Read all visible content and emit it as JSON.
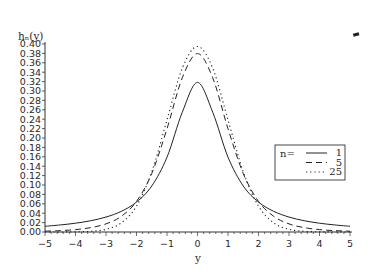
{
  "chart_data": {
    "type": "line",
    "title": "",
    "xlabel": "y",
    "ylabel": "h_n(y)",
    "ylabel_display": "hₙ(y)",
    "xlim": [
      -5,
      5
    ],
    "ylim": [
      0.0,
      0.4
    ],
    "xticks": [
      -5,
      -4,
      -3,
      -2,
      -1,
      0,
      1,
      2,
      3,
      4,
      5
    ],
    "xtick_labels": [
      "−5",
      "−4",
      "−3",
      "−2",
      "−1",
      "0",
      "1",
      "2",
      "3",
      "4",
      "5"
    ],
    "yticks": [
      0.0,
      0.02,
      0.04,
      0.06,
      0.08,
      0.1,
      0.12,
      0.14,
      0.16,
      0.18,
      0.2,
      0.22,
      0.24,
      0.26,
      0.28,
      0.3,
      0.32,
      0.34,
      0.36,
      0.38,
      0.4
    ],
    "ytick_labels": [
      "0.00",
      "0.02",
      "0.04",
      "0.06",
      "0.08",
      "0.10",
      "0.12",
      "0.14",
      "0.16",
      "0.18",
      "0.20",
      "0.22",
      "0.24",
      "0.26",
      "0.28",
      "0.30",
      "0.32",
      "0.34",
      "0.36",
      "0.38",
      "0.40"
    ],
    "grid": false,
    "legend": {
      "title": "n=",
      "position": "right-middle",
      "entries": [
        {
          "label": "1",
          "style": "solid"
        },
        {
          "label": "5",
          "style": "dashed"
        },
        {
          "label": "25",
          "style": "dotted"
        }
      ]
    },
    "x": [
      -5,
      -4.5,
      -4,
      -3.5,
      -3,
      -2.5,
      -2,
      -1.5,
      -1,
      -0.5,
      0,
      0.5,
      1,
      1.5,
      2,
      2.5,
      3,
      3.5,
      4,
      4.5,
      5
    ],
    "series": [
      {
        "name": "n=1",
        "style": "solid",
        "values": [
          0.0122,
          0.015,
          0.0187,
          0.024,
          0.0318,
          0.0439,
          0.0637,
          0.0979,
          0.1592,
          0.2546,
          0.3183,
          0.2546,
          0.1592,
          0.0979,
          0.0637,
          0.0439,
          0.0318,
          0.024,
          0.0187,
          0.015,
          0.0122
        ]
      },
      {
        "name": "n=5",
        "style": "dashed",
        "values": [
          0.0018,
          0.0029,
          0.0051,
          0.0093,
          0.0173,
          0.0333,
          0.0651,
          0.1245,
          0.2197,
          0.3279,
          0.3796,
          0.3279,
          0.2197,
          0.1245,
          0.0651,
          0.0333,
          0.0173,
          0.0093,
          0.0051,
          0.0029,
          0.0018
        ]
      },
      {
        "name": "n=25",
        "style": "dotted",
        "values": [
          0.0,
          0.0001,
          0.0004,
          0.0015,
          0.0057,
          0.0193,
          0.0551,
          0.1282,
          0.2384,
          0.3483,
          0.3948,
          0.3483,
          0.2384,
          0.1282,
          0.0551,
          0.0193,
          0.0057,
          0.0015,
          0.0004,
          0.0001,
          0.0
        ]
      }
    ]
  }
}
